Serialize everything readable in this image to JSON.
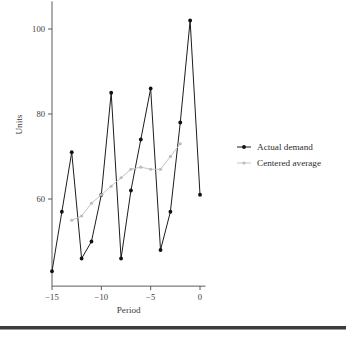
{
  "chart_data": {
    "type": "line",
    "title": "",
    "xlabel": "Period",
    "ylabel": "Units",
    "xlim": [
      -15.8,
      1.0
    ],
    "ylim": [
      38,
      106
    ],
    "xticks": [
      -15,
      -10,
      -5,
      0
    ],
    "xtick_labels": [
      "−15",
      "−10",
      "−5",
      "0"
    ],
    "yticks": [
      60,
      80,
      100
    ],
    "ytick_labels": [
      "60",
      "80",
      "100"
    ],
    "grid": false,
    "legend_position": "right",
    "x": [
      -15,
      -14,
      -13,
      -12,
      -11,
      -10,
      -9,
      -8,
      -7,
      -6,
      -5,
      -4,
      -3,
      -2,
      -1,
      0
    ],
    "series": [
      {
        "name": "Actual demand",
        "color": "#111111",
        "marker": "circle",
        "x": [
          -15,
          -14,
          -13,
          -12,
          -11,
          -10,
          -9,
          -8,
          -7,
          -6,
          -5,
          -4,
          -3,
          -2,
          -1,
          0
        ],
        "values": [
          43,
          57,
          71,
          46,
          50,
          61,
          85,
          46,
          62,
          74,
          86,
          48,
          57,
          78,
          102,
          61
        ]
      },
      {
        "name": "Centered average",
        "color": "#bdbdbd",
        "marker": "circle",
        "x": [
          -13,
          -12,
          -11,
          -10,
          -9,
          -8,
          -7,
          -6,
          -5,
          -4,
          -3,
          -2
        ],
        "values": [
          55,
          56,
          59,
          61,
          63,
          65,
          67,
          67.5,
          67,
          67,
          70,
          73
        ]
      }
    ]
  },
  "legend": {
    "items": [
      {
        "label": "Actual demand",
        "color": "#111111"
      },
      {
        "label": "Centered average",
        "color": "#bdbdbd"
      }
    ]
  },
  "axes": {
    "x_title": "Period",
    "y_title": "Units"
  }
}
